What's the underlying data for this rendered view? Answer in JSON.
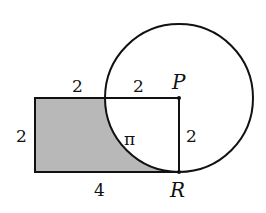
{
  "figure": {
    "labels": {
      "top_left_segment": "2",
      "top_right_segment": "2",
      "left_side": "2",
      "bottom_side": "4",
      "right_side": "2",
      "arc_length": "π",
      "point_p": "P",
      "point_r": "R"
    },
    "colors": {
      "shade": "#b8b8b8",
      "stroke": "#111111",
      "background": "#ffffff"
    }
  }
}
